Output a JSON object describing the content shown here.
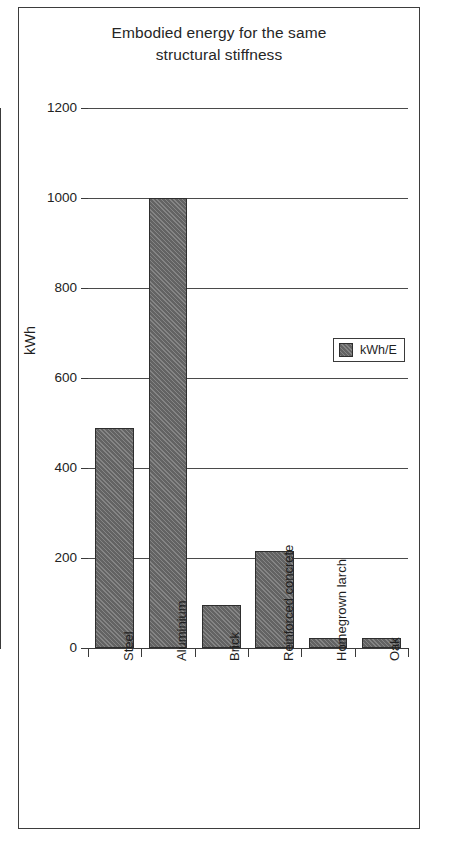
{
  "chart_data": {
    "type": "bar",
    "title": "Embodied energy for the same structural stiffness",
    "title_lines": [
      "Embodied energy for the same",
      "structural stiffness"
    ],
    "xlabel": "",
    "ylabel": "kWh",
    "ylim": [
      0,
      1200
    ],
    "yticks": [
      0,
      200,
      400,
      600,
      800,
      1000,
      1200
    ],
    "ytick_labels": [
      "0",
      "200",
      "400",
      "600",
      "800",
      "1000",
      "1200"
    ],
    "grid": true,
    "grid_axis": "y",
    "legend_position": "center-right",
    "categories": [
      "Steel",
      "Aluminium",
      "Brick",
      "Reinforced concrete",
      "Homegrown larch",
      "Oak"
    ],
    "series": [
      {
        "name": "kWh/E",
        "values": [
          490,
          1000,
          95,
          215,
          22,
          22
        ],
        "color": "#6e6e6e",
        "edge_color": "#2e2e2e",
        "hatch": "diagonal"
      }
    ]
  },
  "legend": {
    "entries": [
      {
        "label": "kWh/E",
        "swatch_color": "#6e6e6e"
      }
    ]
  },
  "axes": {
    "y_title": "kWh",
    "y_tick_labels": [
      "1200",
      "1000",
      "800",
      "600",
      "400",
      "200",
      "0"
    ],
    "x_tick_labels": [
      "Steel",
      "Aluminium",
      "Brick",
      "Reinforced concrete",
      "Homegrown larch",
      "Oak"
    ]
  },
  "colors": {
    "bar_fill": "#6e6e6e",
    "bar_edge": "#2e2e2e",
    "gridline": "#4a4a4a",
    "axis": "#3a3a3a",
    "frame": "#3d3d3d",
    "text": "#1f1f1f",
    "background": "#ffffff"
  }
}
